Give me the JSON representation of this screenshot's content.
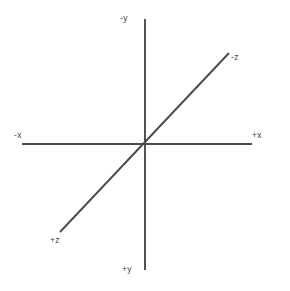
{
  "diagram": {
    "background_color": "#ffffff",
    "line_color": "#4a4a4a",
    "label_color": "#3f3f3f",
    "origin": {
      "x": 145,
      "y": 144
    },
    "axes": [
      {
        "id": "y-axis",
        "name": "vertical-axis",
        "from": {
          "x": 145,
          "y": 19
        },
        "to": {
          "x": 145,
          "y": 270
        },
        "negative_label": "-y",
        "positive_label": "+y"
      },
      {
        "id": "x-axis",
        "name": "horizontal-axis",
        "from": {
          "x": 22,
          "y": 144
        },
        "to": {
          "x": 252,
          "y": 144
        },
        "negative_label": "-x",
        "positive_label": "+x"
      },
      {
        "id": "z-axis",
        "name": "diagonal-axis",
        "from": {
          "x": 60,
          "y": 232
        },
        "to": {
          "x": 229,
          "y": 53
        },
        "negative_label": "-z",
        "positive_label": "+z"
      }
    ],
    "labels": {
      "neg_y": "-y",
      "pos_y": "+y",
      "neg_x": "-x",
      "pos_x": "+x",
      "neg_z": "-z",
      "pos_z": "+z"
    }
  },
  "chart_data": {
    "type": "line",
    "title": "",
    "xlabel": "",
    "ylabel": "",
    "grid": false,
    "legend": false,
    "series": [
      {
        "name": "y-axis",
        "x": [
          145,
          145
        ],
        "y": [
          19,
          270
        ]
      },
      {
        "name": "x-axis",
        "x": [
          22,
          252
        ],
        "y": [
          144,
          144
        ]
      },
      {
        "name": "z-axis",
        "x": [
          60,
          229
        ],
        "y": [
          232,
          53
        ]
      }
    ],
    "annotations": [
      {
        "text": "-y",
        "x": 124,
        "y": 18
      },
      {
        "text": "+y",
        "x": 126,
        "y": 269
      },
      {
        "text": "-x",
        "x": 18,
        "y": 135
      },
      {
        "text": "+x",
        "x": 256,
        "y": 135
      },
      {
        "text": "-z",
        "x": 235,
        "y": 57
      },
      {
        "text": "+z",
        "x": 54,
        "y": 240
      }
    ],
    "xlim": [
      0,
      290
    ],
    "ylim": [
      291,
      0
    ]
  }
}
